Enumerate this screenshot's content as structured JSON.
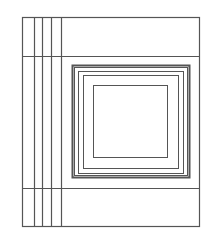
{
  "diagram": {
    "type": "line-drawing",
    "stroke_color": "#555555",
    "background": "#ffffff",
    "outer_frame": {
      "x": 22,
      "y": 17,
      "w": 177,
      "h": 209
    },
    "horizontal_lines": [
      {
        "y": 56
      },
      {
        "y": 188
      }
    ],
    "vertical_lines": [
      {
        "x": 34
      },
      {
        "x": 42
      },
      {
        "x": 51
      },
      {
        "x": 61
      }
    ],
    "nested_squares": [
      {
        "x": 72,
        "y": 65,
        "w": 117,
        "h": 112,
        "stroke_width": 2
      },
      {
        "x": 74,
        "y": 67,
        "w": 113,
        "h": 108,
        "stroke_width": 1
      },
      {
        "x": 78,
        "y": 71,
        "w": 105,
        "h": 102,
        "stroke_width": 1
      },
      {
        "x": 83,
        "y": 75,
        "w": 95,
        "h": 93,
        "stroke_width": 1
      },
      {
        "x": 93,
        "y": 85,
        "w": 74,
        "h": 72,
        "stroke_width": 1
      }
    ]
  }
}
